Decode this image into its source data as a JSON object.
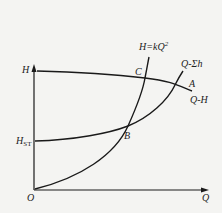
{
  "diagram": {
    "type": "pump-system characteristic curves",
    "axes": {
      "y_label": "H",
      "x_label": "Q",
      "origin_label": "O"
    },
    "labels": {
      "h_static_main": "H",
      "h_static_sub": "ST",
      "system_curve_kq2_prefix": "H=kQ",
      "system_curve_kq2_exp": "2",
      "pipe_curve": "Q-Σh",
      "pump_curve": "Q-H",
      "point_a": "A",
      "point_b": "B",
      "point_c": "C"
    },
    "curves": [
      {
        "name": "Q-H",
        "description": "pump head curve, slightly descending"
      },
      {
        "name": "Q-Σh",
        "description": "pipe system curve starting at H_ST, rising"
      },
      {
        "name": "H=kQ²",
        "description": "parabola from origin"
      }
    ],
    "points": [
      {
        "name": "A",
        "description": "intersection of Q-H and Q-Σh"
      },
      {
        "name": "B",
        "description": "intersection of Q-Σh and H=kQ²"
      },
      {
        "name": "C",
        "description": "intersection of Q-H and H=kQ²"
      }
    ],
    "colors": {
      "line": "#1a1a1a",
      "background": "#f4f4f2"
    }
  }
}
